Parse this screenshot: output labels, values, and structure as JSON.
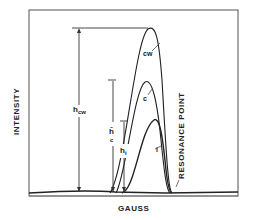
{
  "figure": {
    "ylabel": "INTENSITY",
    "xlabel": "GAUSS",
    "annotation": "RESONANCE POINT",
    "curves": [
      {
        "label": "cw",
        "peak_fraction": 0.86
      },
      {
        "label": "c",
        "peak_fraction": 0.46
      },
      {
        "label": "i",
        "peak_fraction": 0.33
      }
    ],
    "heights": [
      {
        "label": "h",
        "subscript": "cw"
      },
      {
        "label": "ĥ",
        "subscript": "c"
      },
      {
        "label": "h",
        "subscript": "i"
      }
    ],
    "colors": {
      "ink": "#222222",
      "frame": "#555555",
      "background": "#ffffff"
    }
  }
}
